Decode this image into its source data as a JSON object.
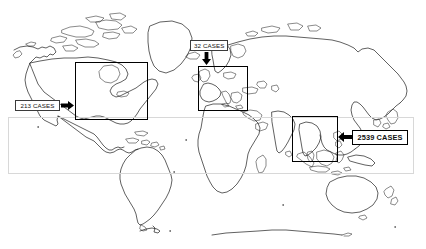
{
  "figure": {
    "type": "world-map-annotated",
    "title": "",
    "background_color": "#ffffff",
    "line_color": "#1c1c1c"
  },
  "chart_data": {
    "type": "map",
    "title": "",
    "subtitle": "",
    "xlabel": "",
    "ylabel": "",
    "unit": "CASES",
    "regions": [
      {
        "id": "north-america",
        "label": "213 CASES",
        "value": 213,
        "box": {
          "x": 75,
          "y": 62,
          "w": 73,
          "h": 58
        },
        "callout": {
          "x": 15,
          "y": 100,
          "w": 45,
          "h": 11
        },
        "arrow": {
          "direction": "right",
          "x": 61,
          "y": 101,
          "w": 13,
          "h": 9
        },
        "style": "plain"
      },
      {
        "id": "europe",
        "label": "32 CASES",
        "value": 32,
        "box": {
          "x": 198,
          "y": 66,
          "w": 50,
          "h": 45
        },
        "callout": {
          "x": 190,
          "y": 40,
          "w": 38,
          "h": 11
        },
        "arrow": {
          "direction": "down",
          "x": 202,
          "y": 52,
          "w": 9,
          "h": 13
        },
        "style": "plain"
      },
      {
        "id": "southeast-asia",
        "label": "2539 CASES",
        "value": 2539,
        "box": {
          "x": 292,
          "y": 116,
          "w": 46,
          "h": 46
        },
        "callout": {
          "x": 352,
          "y": 130,
          "w": 56,
          "h": 15
        },
        "arrow": {
          "direction": "left",
          "x": 338,
          "y": 132,
          "w": 14,
          "h": 10
        },
        "style": "bold"
      }
    ],
    "tropical_band": {
      "label": "",
      "x": 8,
      "y": 117,
      "w": 406,
      "h": 57,
      "color": "#d8d8d8"
    },
    "legend": [],
    "annotations": []
  }
}
